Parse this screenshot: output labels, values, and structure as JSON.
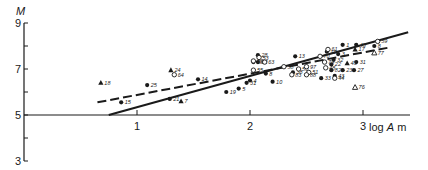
{
  "chart_data": {
    "type": "scatter",
    "title": "",
    "xlabel": "log A m",
    "ylabel": "M",
    "xlim": [
      0,
      3.4
    ],
    "ylim": [
      3,
      9
    ],
    "x_ticks": [
      1,
      2,
      3
    ],
    "x_tick_labels": [
      "1",
      "2",
      "3"
    ],
    "y_ticks": [
      3,
      5,
      7,
      9
    ],
    "y_tick_labels": [
      "3",
      "5",
      "7",
      "9"
    ],
    "y_minor_ticks": [
      4,
      6,
      8
    ],
    "grid": false,
    "legend": null,
    "marker_types": {
      "filled-circle": "●",
      "open-circle": "○",
      "filled-triangle": "▲",
      "open-triangle": "△"
    },
    "series": [
      {
        "name": "filled-circle",
        "points": [
          {
            "label": "15",
            "x": 0.86,
            "y": 5.55
          },
          {
            "label": "25",
            "x": 1.09,
            "y": 6.3
          },
          {
            "label": "21",
            "x": 1.29,
            "y": 5.7
          },
          {
            "label": "14",
            "x": 1.54,
            "y": 6.55
          },
          {
            "label": "19",
            "x": 1.79,
            "y": 6.0
          },
          {
            "label": "5",
            "x": 1.9,
            "y": 6.15
          },
          {
            "label": "31",
            "x": 1.97,
            "y": 6.4
          },
          {
            "label": "4",
            "x": 2.0,
            "y": 6.5
          },
          {
            "label": "10",
            "x": 2.2,
            "y": 6.45
          },
          {
            "label": "8",
            "x": 2.14,
            "y": 6.8
          },
          {
            "label": "28",
            "x": 2.07,
            "y": 7.6
          },
          {
            "label": "18",
            "x": 2.03,
            "y": 7.3
          },
          {
            "label": "12",
            "x": 2.07,
            "y": 7.3
          },
          {
            "label": "13",
            "x": 2.4,
            "y": 7.55
          },
          {
            "label": "38",
            "x": 2.38,
            "y": 6.85
          },
          {
            "label": "33",
            "x": 2.63,
            "y": 6.6
          },
          {
            "label": "43",
            "x": 2.75,
            "y": 6.7
          },
          {
            "label": "1",
            "x": 2.82,
            "y": 8.05
          },
          {
            "label": "11",
            "x": 2.68,
            "y": 7.75
          },
          {
            "label": "3",
            "x": 2.78,
            "y": 7.65
          },
          {
            "label": "45",
            "x": 2.94,
            "y": 8.05
          },
          {
            "label": "22",
            "x": 2.72,
            "y": 7.2
          },
          {
            "label": "23",
            "x": 2.82,
            "y": 6.95
          },
          {
            "label": "82",
            "x": 2.72,
            "y": 6.95
          },
          {
            "label": "31b",
            "x": 2.94,
            "y": 7.3
          },
          {
            "label": "27",
            "x": 2.92,
            "y": 6.95
          },
          {
            "label": "8b",
            "x": 3.1,
            "y": 8.0
          },
          {
            "label": "32",
            "x": 2.74,
            "y": 7.4
          }
        ]
      },
      {
        "name": "open-circle",
        "points": [
          {
            "label": "64",
            "x": 1.33,
            "y": 6.75
          },
          {
            "label": "20",
            "x": 2.03,
            "y": 7.35
          },
          {
            "label": "53",
            "x": 2.08,
            "y": 7.5
          },
          {
            "label": "55",
            "x": 2.03,
            "y": 6.95
          },
          {
            "label": "63",
            "x": 2.13,
            "y": 7.3
          },
          {
            "label": "58",
            "x": 2.3,
            "y": 7.1
          },
          {
            "label": "83",
            "x": 2.37,
            "y": 6.75
          },
          {
            "label": "50",
            "x": 2.43,
            "y": 7.0
          },
          {
            "label": "97",
            "x": 2.5,
            "y": 7.1
          },
          {
            "label": "51",
            "x": 2.52,
            "y": 6.85
          },
          {
            "label": "88",
            "x": 2.5,
            "y": 6.75
          },
          {
            "label": "70",
            "x": 2.62,
            "y": 7.55
          },
          {
            "label": "61",
            "x": 2.69,
            "y": 7.85
          },
          {
            "label": "79",
            "x": 2.66,
            "y": 7.3
          },
          {
            "label": "48",
            "x": 2.67,
            "y": 7.05
          },
          {
            "label": "44",
            "x": 2.75,
            "y": 6.6
          },
          {
            "label": "59",
            "x": 3.13,
            "y": 8.2
          }
        ]
      },
      {
        "name": "filled-triangle",
        "points": [
          {
            "label": "18",
            "x": 0.68,
            "y": 6.4
          },
          {
            "label": "24",
            "x": 1.3,
            "y": 6.95
          },
          {
            "label": "7",
            "x": 1.39,
            "y": 5.6
          },
          {
            "label": "17",
            "x": 2.93,
            "y": 7.85
          },
          {
            "label": "43b",
            "x": 2.86,
            "y": 7.25
          }
        ]
      },
      {
        "name": "open-triangle",
        "points": [
          {
            "label": "76",
            "x": 2.93,
            "y": 6.2
          },
          {
            "label": "77",
            "x": 3.1,
            "y": 7.7
          }
        ]
      }
    ],
    "lines": [
      {
        "name": "solid-regression",
        "style": "solid",
        "x": [
          0.75,
          3.4
        ],
        "y": [
          5.0,
          8.6
        ]
      },
      {
        "name": "dashed-regression",
        "style": "dashed",
        "x": [
          0.65,
          3.25
        ],
        "y": [
          5.55,
          7.95
        ]
      }
    ]
  },
  "axes": {
    "x_title_prefix": "log ",
    "x_title_var": "A",
    "x_title_unit": " m",
    "y_title": "M"
  }
}
